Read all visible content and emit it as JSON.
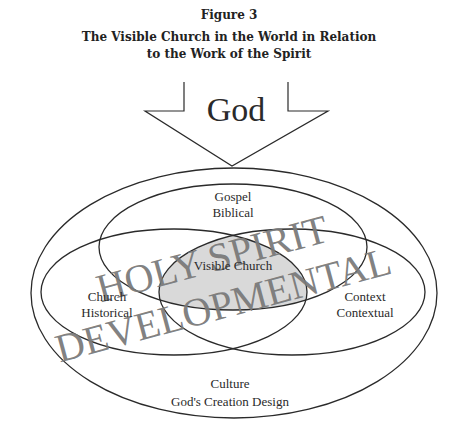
{
  "figure": {
    "number": "Figure 3",
    "title_line1": "The Visible Church in the World in Relation",
    "title_line2": "to the Work of the Spirit"
  },
  "arrow": {
    "label": "God"
  },
  "sets": {
    "gospel": {
      "line1": "Gospel",
      "line2": "Biblical"
    },
    "church": {
      "line1": "Church",
      "line2": "Historical"
    },
    "context": {
      "line1": "Context",
      "line2": "Contextual"
    },
    "culture": {
      "line1": "Culture",
      "line2": "God's Creation Design"
    },
    "center": {
      "label": "Visible Church"
    }
  },
  "watermark": {
    "line1": "HOLY SPIRIT",
    "line2": "DEVELOPMENTAL"
  },
  "colors": {
    "stroke": "#2a2a2a",
    "center_fill": "#d9d9d9",
    "watermark": "#7a7a7a"
  }
}
